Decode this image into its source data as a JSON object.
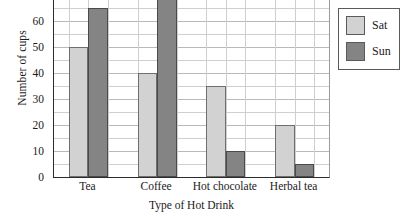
{
  "chart_data": {
    "type": "bar",
    "title": "",
    "xlabel": "Type of Hot Drink",
    "ylabel": "Number of cups",
    "categories": [
      "Tea",
      "Coffee",
      "Hot chocolate",
      "Herbal tea"
    ],
    "series": [
      {
        "name": "Sat",
        "color": "#d2d2d2",
        "values": [
          50,
          40,
          35,
          20
        ]
      },
      {
        "name": "Sun",
        "color": "#848484",
        "values": [
          65,
          70,
          10,
          5
        ]
      }
    ],
    "ylim": [
      0,
      75
    ],
    "y_ticks": [
      0,
      10,
      20,
      30,
      40,
      50,
      60,
      70
    ],
    "y_tick_labels": [
      "0",
      "10",
      "20",
      "30",
      "40",
      "50",
      "60",
      "70"
    ],
    "y_minor_step": 5,
    "grid": true,
    "legend_position": "right-outside"
  },
  "legend": {
    "entries": [
      {
        "label": "Sat"
      },
      {
        "label": "Sun"
      }
    ]
  }
}
